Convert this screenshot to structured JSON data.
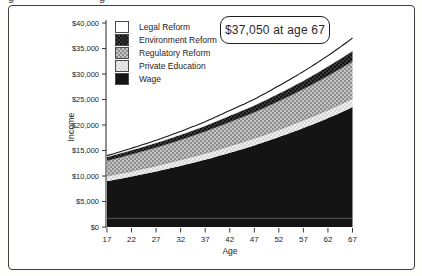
{
  "chart_data": {
    "type": "area",
    "stacked": true,
    "title": "",
    "xlabel": "Age",
    "ylabel": "Income",
    "x": [
      17,
      22,
      27,
      32,
      37,
      42,
      47,
      52,
      57,
      62,
      67
    ],
    "xlim": [
      17,
      67
    ],
    "ylim": [
      0,
      40000
    ],
    "grid": false,
    "legend_position": "top-left-inside",
    "y_ticks": [
      {
        "value": 0,
        "label": "$0"
      },
      {
        "value": 5000,
        "label": "$5,000"
      },
      {
        "value": 10000,
        "label": "$10,000"
      },
      {
        "value": 15000,
        "label": "$15,000"
      },
      {
        "value": 20000,
        "label": "$20,000"
      },
      {
        "value": 25000,
        "label": "$25,000"
      },
      {
        "value": 30000,
        "label": "$30,000"
      },
      {
        "value": 35000,
        "label": "$35,000"
      },
      {
        "value": 40000,
        "label": "$40,000"
      }
    ],
    "series": [
      {
        "name": "Wage",
        "pattern": "solid-black",
        "values": [
          9000,
          9900,
          10900,
          12000,
          13200,
          14550,
          16000,
          17650,
          19400,
          21350,
          23500
        ]
      },
      {
        "name": "Private Education",
        "pattern": "light-checker",
        "values": [
          1000,
          1050,
          1100,
          1200,
          1250,
          1350,
          1400,
          1450,
          1550,
          1600,
          1700
        ]
      },
      {
        "name": "Regulatory Reform",
        "pattern": "mid-checker",
        "values": [
          3000,
          3300,
          3600,
          3900,
          4300,
          4700,
          5100,
          5600,
          6100,
          6700,
          7300
        ]
      },
      {
        "name": "Environment Reform",
        "pattern": "dark-checker",
        "values": [
          700,
          800,
          850,
          950,
          1050,
          1200,
          1300,
          1450,
          1600,
          1800,
          2000
        ]
      },
      {
        "name": "Legal Reform",
        "pattern": "white",
        "values": [
          300,
          400,
          550,
          700,
          850,
          1050,
          1250,
          1550,
          1850,
          2150,
          2550
        ]
      }
    ],
    "legend": [
      {
        "label": "Legal Reform",
        "pattern": "white"
      },
      {
        "label": "Environment Reform",
        "pattern": "dark-checker"
      },
      {
        "label": "Regulatory Reform",
        "pattern": "mid-checker"
      },
      {
        "label": "Private Education",
        "pattern": "light-checker"
      },
      {
        "label": "Wage",
        "pattern": "solid-black"
      }
    ],
    "annotation": "$37,050 at age 67",
    "annotation_point": {
      "age": 67,
      "value": 37050
    },
    "artifact_line_value": 1700
  },
  "colors": {
    "ink": "#1d1d1d",
    "frame_border": "#3f3f3f",
    "wage_black": "#141414",
    "mid_checker_light": "#c3c3c3",
    "mid_checker_dark": "#8d8d8d",
    "light_checker_light": "#eeeeee",
    "light_checker_dark": "#d7d7d7",
    "dark_checker_light": "#3a3a3a",
    "dark_checker_dark": "#141414",
    "artifact_line": "#6f6f6f"
  }
}
